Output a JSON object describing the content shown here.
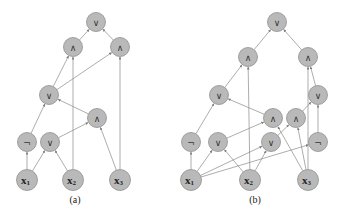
{
  "diagrams": [
    {
      "id": "a",
      "caption": "(a)",
      "nodes": [
        {
          "id": "a_or_top",
          "label": "∨",
          "x": 96,
          "y": 22
        },
        {
          "id": "a_and_l",
          "label": "∧",
          "x": 73,
          "y": 47
        },
        {
          "id": "a_and_r",
          "label": "∧",
          "x": 120,
          "y": 47
        },
        {
          "id": "a_or_mid",
          "label": "∨",
          "x": 49,
          "y": 95
        },
        {
          "id": "a_and_low",
          "label": "∧",
          "x": 97,
          "y": 118
        },
        {
          "id": "a_not",
          "label": "¬",
          "x": 27,
          "y": 142
        },
        {
          "id": "a_or_low",
          "label": "∨",
          "x": 50,
          "y": 142
        },
        {
          "id": "a_x1",
          "label": "x",
          "sub": "1",
          "x": 27,
          "y": 180,
          "input": true
        },
        {
          "id": "a_x2",
          "label": "x",
          "sub": "2",
          "x": 73,
          "y": 180,
          "input": true
        },
        {
          "id": "a_x3",
          "label": "x",
          "sub": "3",
          "x": 120,
          "y": 180,
          "input": true
        }
      ],
      "edges": [
        [
          "a_and_l",
          "a_or_top"
        ],
        [
          "a_and_r",
          "a_or_top"
        ],
        [
          "a_or_mid",
          "a_and_l"
        ],
        [
          "a_or_mid",
          "a_and_r"
        ],
        [
          "a_x2",
          "a_and_l"
        ],
        [
          "a_x3",
          "a_and_r"
        ],
        [
          "a_not",
          "a_or_mid"
        ],
        [
          "a_and_low",
          "a_or_mid"
        ],
        [
          "a_or_low",
          "a_and_low"
        ],
        [
          "a_x3",
          "a_and_low"
        ],
        [
          "a_x1",
          "a_not"
        ],
        [
          "a_x1",
          "a_or_low"
        ],
        [
          "a_x2",
          "a_or_low"
        ]
      ],
      "caption_pos": {
        "x": 75,
        "y": 203
      }
    },
    {
      "id": "b",
      "caption": "(b)",
      "nodes": [
        {
          "id": "b_or_top",
          "label": "∨",
          "x": 277,
          "y": 22
        },
        {
          "id": "b_and_l",
          "label": "∧",
          "x": 248,
          "y": 57
        },
        {
          "id": "b_and_r",
          "label": "∧",
          "x": 308,
          "y": 57
        },
        {
          "id": "b_or_l",
          "label": "∨",
          "x": 219,
          "y": 95
        },
        {
          "id": "b_or_r",
          "label": "∨",
          "x": 318,
          "y": 95
        },
        {
          "id": "b_and_m1",
          "label": "∧",
          "x": 273,
          "y": 118
        },
        {
          "id": "b_and_m2",
          "label": "∧",
          "x": 296,
          "y": 118
        },
        {
          "id": "b_not_l",
          "label": "¬",
          "x": 191,
          "y": 142
        },
        {
          "id": "b_or_low1",
          "label": "∨",
          "x": 218,
          "y": 142
        },
        {
          "id": "b_or_low2",
          "label": "∨",
          "x": 271,
          "y": 142
        },
        {
          "id": "b_not_r",
          "label": "¬",
          "x": 318,
          "y": 142
        },
        {
          "id": "b_x1",
          "label": "x",
          "sub": "1",
          "x": 191,
          "y": 180,
          "input": true
        },
        {
          "id": "b_x2",
          "label": "x",
          "sub": "2",
          "x": 250,
          "y": 180,
          "input": true
        },
        {
          "id": "b_x3",
          "label": "x",
          "sub": "3",
          "x": 308,
          "y": 180,
          "input": true
        }
      ],
      "edges": [
        [
          "b_and_l",
          "b_or_top"
        ],
        [
          "b_and_r",
          "b_or_top"
        ],
        [
          "b_or_l",
          "b_and_l"
        ],
        [
          "b_x2",
          "b_and_l"
        ],
        [
          "b_x3",
          "b_and_r"
        ],
        [
          "b_or_r",
          "b_and_r"
        ],
        [
          "b_not_l",
          "b_or_l"
        ],
        [
          "b_and_m1",
          "b_or_l"
        ],
        [
          "b_and_m2",
          "b_or_r"
        ],
        [
          "b_not_r",
          "b_or_r"
        ],
        [
          "b_or_low1",
          "b_and_m1"
        ],
        [
          "b_x3",
          "b_and_m1"
        ],
        [
          "b_or_low2",
          "b_and_m2"
        ],
        [
          "b_x3",
          "b_and_m2"
        ],
        [
          "b_x1",
          "b_not_l"
        ],
        [
          "b_x1",
          "b_or_low1"
        ],
        [
          "b_x2",
          "b_or_low1"
        ],
        [
          "b_x1",
          "b_or_low2"
        ],
        [
          "b_x2",
          "b_or_low2"
        ],
        [
          "b_x1",
          "b_not_r"
        ]
      ],
      "caption_pos": {
        "x": 255,
        "y": 203
      }
    }
  ],
  "style": {
    "node_fill": "#b9b9b9",
    "node_stroke": "#8f8f8f",
    "edge_color": "#8a8a8a",
    "node_radius": 9.5,
    "input_radius": 10.5
  }
}
